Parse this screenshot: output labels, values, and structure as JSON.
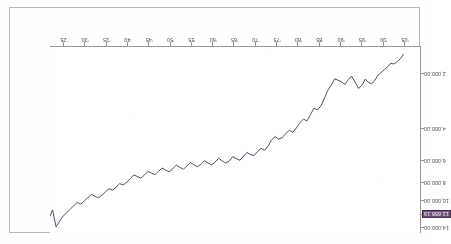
{
  "figure": {
    "orientation": "rotated-180",
    "line_color": "#4a3550",
    "axis_color": "#9a9a9a",
    "frame_color": "#b9b9b9",
    "highlight_bg": "#6d4f77",
    "highlight_fg": "#ffffff"
  },
  "chart_data": {
    "type": "line",
    "title": "",
    "subtitle": "",
    "xlabel": "",
    "ylabel": "",
    "grid": false,
    "legend": "none",
    "yscale": "log",
    "ylim": [
      1400,
      15000
    ],
    "yticks": [
      2000,
      4000,
      6000,
      8000,
      10000,
      12000,
      14000
    ],
    "ytick_labels": [
      "2,000.00",
      "4,000.00",
      "6,000.00",
      "8,000.00",
      "10,000.00",
      "12,658.19",
      "14,000.00"
    ],
    "highlighted_ytick_index": 5,
    "highlighted_value_label": "12,658.19",
    "xticks": [
      "05",
      "00",
      "95",
      "90",
      "85",
      "80",
      "75",
      "70",
      "65",
      "60",
      "55",
      "50",
      "45",
      "40",
      "35",
      "30",
      "25"
    ],
    "xtick_order_left_to_right_as_scanned": [
      "05",
      "00",
      "95",
      "90",
      "85",
      "80",
      "75",
      "70",
      "65",
      "60",
      "55",
      "50",
      "45",
      "40",
      "35",
      "30",
      "25"
    ],
    "x_domain_years": [
      1925,
      2009
    ],
    "series": [
      {
        "name": "index",
        "x": [
          1928.8,
          1929.4,
          1930.1,
          1930.9,
          1931.6,
          1932.3,
          1933.0,
          1933.8,
          1934.5,
          1935.3,
          1936.0,
          1936.8,
          1937.4,
          1938.1,
          1938.9,
          1939.7,
          1940.5,
          1941.2,
          1942.0,
          1942.8,
          1943.6,
          1944.3,
          1945.1,
          1945.9,
          1946.6,
          1947.4,
          1948.2,
          1949.0,
          1949.8,
          1950.6,
          1951.4,
          1952.2,
          1953.0,
          1953.8,
          1954.6,
          1955.4,
          1956.2,
          1957.0,
          1957.8,
          1958.6,
          1959.4,
          1960.2,
          1961.0,
          1961.8,
          1962.6,
          1963.4,
          1964.2,
          1965.0,
          1965.8,
          1966.6,
          1967.4,
          1968.2,
          1969.0,
          1969.8,
          1970.6,
          1971.4,
          1972.2,
          1973.0,
          1973.8,
          1974.6,
          1975.4,
          1976.2,
          1977.0,
          1977.8,
          1978.6,
          1979.4,
          1980.2,
          1981.0,
          1981.8,
          1982.6,
          1983.4,
          1984.2,
          1985.0,
          1985.8,
          1986.6,
          1987.4,
          1988.2,
          1989.0,
          1989.8,
          1990.6,
          1991.4,
          1992.2,
          1993.0,
          1993.8,
          1994.6,
          1995.4,
          1996.2,
          1997.0,
          1997.8,
          1998.6,
          1999.4,
          2000.2,
          2001.0,
          2001.8,
          2002.6,
          2003.4,
          2004.2,
          2005.0,
          2005.8,
          2006.6,
          2007.4,
          2008.2,
          2009.0
        ],
        "y": [
          1560,
          1640,
          1700,
          1760,
          1740,
          1820,
          1880,
          1960,
          2020,
          2180,
          2260,
          2210,
          2130,
          2300,
          2400,
          2210,
          2050,
          2140,
          2280,
          2200,
          2160,
          2120,
          2300,
          2460,
          2700,
          2980,
          3150,
          3080,
          3340,
          3620,
          3540,
          3700,
          3960,
          4180,
          4080,
          4250,
          4480,
          4560,
          4420,
          4600,
          4980,
          5260,
          5120,
          5350,
          5620,
          5540,
          5400,
          5680,
          5960,
          5840,
          5700,
          6020,
          6180,
          6000,
          5820,
          6100,
          6320,
          6180,
          6000,
          6280,
          6480,
          6300,
          6150,
          6420,
          6680,
          6520,
          6340,
          6650,
          6900,
          6740,
          6580,
          6860,
          7150,
          7020,
          6880,
          7180,
          7480,
          7320,
          7180,
          7520,
          7880,
          8150,
          8020,
          8380,
          8720,
          8560,
          8900,
          9280,
          9600,
          9420,
          9200,
          9580,
          9980,
          10400,
          10180,
          10600,
          11100,
          11600,
          12100,
          12900,
          13900,
          11200,
          12450
        ]
      }
    ],
    "annotations": [
      {
        "text": "12,658.19",
        "role": "current-value-callout",
        "axis": "y",
        "style": "highlighted"
      }
    ]
  }
}
